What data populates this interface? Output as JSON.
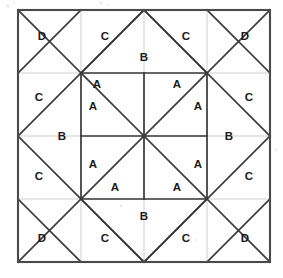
{
  "figure": {
    "name": "quilt-block-diagram",
    "title": "",
    "background_color": "#ffffff",
    "border_color": "#4a4a4a",
    "grid_color": "#c9c9c9",
    "pattern_color": "#3a3a3a",
    "label_color": "#1a1a1a",
    "frame": {
      "x": 18,
      "y": 10,
      "width": 252,
      "height": 252
    },
    "grid_divisions": 4,
    "cell_size": 63,
    "labels": [
      {
        "id": "label-d-top-left",
        "text": "D",
        "x": 42,
        "y": 36
      },
      {
        "id": "label-c-top-left-mid",
        "text": "C",
        "x": 105,
        "y": 36
      },
      {
        "id": "label-b-top",
        "text": "B",
        "x": 144,
        "y": 57
      },
      {
        "id": "label-c-top-right-mid",
        "text": "C",
        "x": 186,
        "y": 36
      },
      {
        "id": "label-d-top-right",
        "text": "D",
        "x": 245,
        "y": 36
      },
      {
        "id": "label-c-left-upper",
        "text": "C",
        "x": 39,
        "y": 97
      },
      {
        "id": "label-a-upper-left",
        "text": "A",
        "x": 97,
        "y": 84
      },
      {
        "id": "label-a-upper-right",
        "text": "A",
        "x": 177,
        "y": 84
      },
      {
        "id": "label-c-right-upper",
        "text": "C",
        "x": 249,
        "y": 97
      },
      {
        "id": "label-a-mid-upper-l",
        "text": "A",
        "x": 93,
        "y": 106
      },
      {
        "id": "label-a-mid-upper-r",
        "text": "A",
        "x": 198,
        "y": 106
      },
      {
        "id": "label-b-left",
        "text": "B",
        "x": 62,
        "y": 136
      },
      {
        "id": "label-b-right",
        "text": "B",
        "x": 229,
        "y": 136
      },
      {
        "id": "label-a-mid-lower-l",
        "text": "A",
        "x": 93,
        "y": 164
      },
      {
        "id": "label-a-mid-lower-r",
        "text": "A",
        "x": 198,
        "y": 164
      },
      {
        "id": "label-c-left-lower",
        "text": "C",
        "x": 39,
        "y": 176
      },
      {
        "id": "label-a-lower-left",
        "text": "A",
        "x": 115,
        "y": 187
      },
      {
        "id": "label-a-lower-right",
        "text": "A",
        "x": 177,
        "y": 187
      },
      {
        "id": "label-c-right-lower",
        "text": "C",
        "x": 249,
        "y": 176
      },
      {
        "id": "label-d-bottom-left",
        "text": "D",
        "x": 42,
        "y": 238
      },
      {
        "id": "label-c-bot-left-mid",
        "text": "C",
        "x": 105,
        "y": 238
      },
      {
        "id": "label-b-bottom",
        "text": "B",
        "x": 144,
        "y": 216
      },
      {
        "id": "label-c-bot-right-mid",
        "text": "C",
        "x": 186,
        "y": 238
      },
      {
        "id": "label-d-bottom-right",
        "text": "D",
        "x": 245,
        "y": 238
      }
    ],
    "legend_keys": [
      "A",
      "B",
      "C",
      "D"
    ]
  }
}
